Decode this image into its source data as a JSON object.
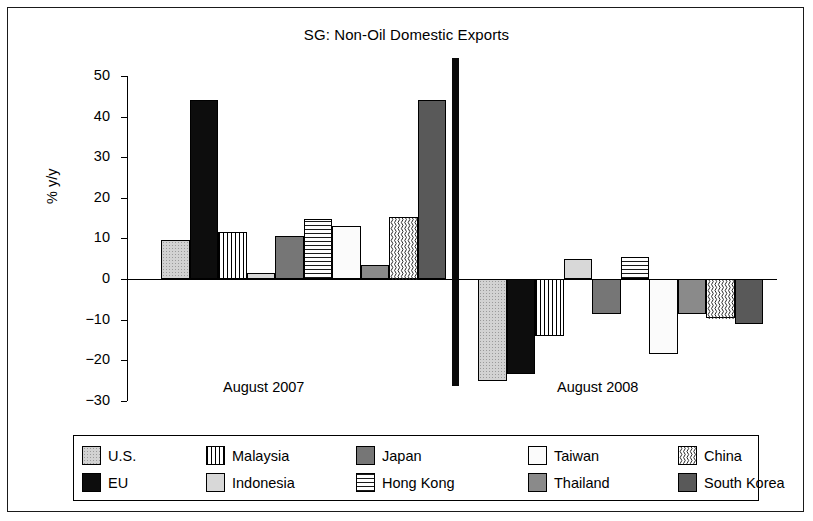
{
  "chart_data": {
    "type": "bar",
    "title": "SG: Non-Oil Domestic Exports",
    "xlabel": "",
    "ylabel": "% y/y",
    "ylim": [
      -30,
      50
    ],
    "yticks": [
      50,
      40,
      30,
      20,
      10,
      0,
      -10,
      -20,
      -30
    ],
    "ytick_labels": [
      "50",
      "40",
      "30",
      "20",
      "10",
      "0",
      "−10",
      "−20",
      "−30"
    ],
    "grid": false,
    "legend_position": "bottom",
    "group_labels": [
      "August 2007",
      "August 2008"
    ],
    "categories": [
      "U.S.",
      "EU",
      "Malaysia",
      "Indonesia",
      "Japan",
      "Hong Kong",
      "Taiwan",
      "Thailand",
      "China",
      "South Korea"
    ],
    "series": [
      {
        "name": "August 2007",
        "values": [
          9.5,
          44.0,
          11.5,
          1.5,
          10.5,
          14.7,
          13.0,
          3.5,
          15.3,
          44.0
        ]
      },
      {
        "name": "August 2008",
        "values": [
          -25.0,
          -23.5,
          -14.0,
          5.0,
          -8.5,
          5.5,
          -18.5,
          -8.7,
          -9.5,
          -11.0
        ]
      }
    ],
    "patterns": [
      "dotted-light-gray",
      "solid-black",
      "vertical-stripes",
      "solid-light-gray",
      "solid-dark-gray",
      "horizontal-stripes",
      "white",
      "solid-medium-gray",
      "wavy-vertical",
      "solid-darker-gray"
    ]
  },
  "legend": {
    "items": [
      {
        "label": "U.S.",
        "pattern": "p-us"
      },
      {
        "label": "Malaysia",
        "pattern": "p-malaysia"
      },
      {
        "label": "Japan",
        "pattern": "p-japan"
      },
      {
        "label": "Taiwan",
        "pattern": "p-taiwan"
      },
      {
        "label": "China",
        "pattern": "p-china"
      },
      {
        "label": "EU",
        "pattern": "p-eu"
      },
      {
        "label": "Indonesia",
        "pattern": "p-indonesia"
      },
      {
        "label": "Hong Kong",
        "pattern": "p-hongkong"
      },
      {
        "label": "Thailand",
        "pattern": "p-thailand"
      },
      {
        "label": "South Korea",
        "pattern": "p-korea"
      }
    ]
  }
}
